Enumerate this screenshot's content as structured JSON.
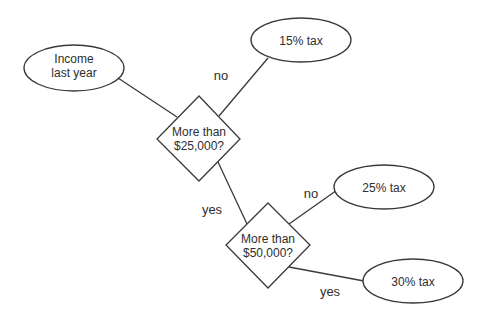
{
  "diagram": {
    "type": "decision-flowchart",
    "nodes": {
      "income": {
        "shape": "ellipse",
        "line1": "Income",
        "line2": "last year"
      },
      "decision1": {
        "shape": "diamond",
        "line1": "More than",
        "line2": "$25,000?"
      },
      "tax15": {
        "shape": "ellipse",
        "label": "15% tax"
      },
      "decision2": {
        "shape": "diamond",
        "line1": "More than",
        "line2": "$50,000?"
      },
      "tax25": {
        "shape": "ellipse",
        "label": "25% tax"
      },
      "tax30": {
        "shape": "ellipse",
        "label": "30% tax"
      }
    },
    "edges": {
      "income_to_d1": {
        "from": "income",
        "to": "decision1",
        "label": ""
      },
      "d1_no": {
        "from": "decision1",
        "to": "tax15",
        "label": "no"
      },
      "d1_yes": {
        "from": "decision1",
        "to": "decision2",
        "label": "yes"
      },
      "d2_no": {
        "from": "decision2",
        "to": "tax25",
        "label": "no"
      },
      "d2_yes": {
        "from": "decision2",
        "to": "tax30",
        "label": "yes"
      }
    },
    "colors": {
      "stroke": "#3a3a3a",
      "text": "#2e2e2e",
      "background": "#ffffff"
    }
  }
}
